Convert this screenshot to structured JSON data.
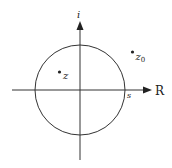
{
  "diagram": {
    "title": "",
    "axes": {
      "horizontal_label": "R",
      "vertical_label": "i"
    },
    "circle": {
      "center": [
        80,
        90
      ],
      "radius": 45,
      "radius_label": "s"
    },
    "points": [
      {
        "name": "z",
        "label_main": "z",
        "label_sub": "",
        "position": "inside circle"
      },
      {
        "name": "z0",
        "label_main": "z",
        "label_sub": "0",
        "position": "outside circle"
      }
    ],
    "colors": {
      "stroke": "#333333",
      "background": "#ffffff"
    }
  }
}
